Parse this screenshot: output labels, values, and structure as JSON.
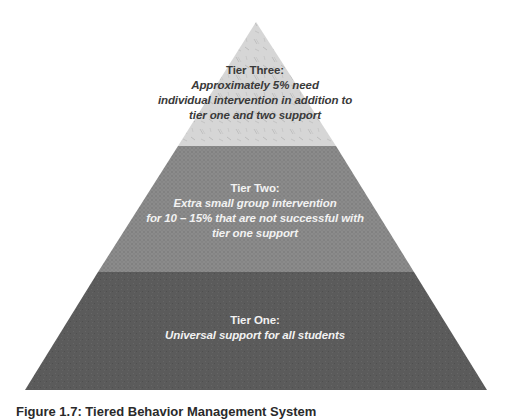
{
  "diagram": {
    "type": "pyramid",
    "apex": {
      "x": 256,
      "y": 22
    },
    "base": {
      "left": 25,
      "right": 487,
      "y": 390
    },
    "tiers": [
      {
        "id": "tier-three",
        "title": "Tier Three:",
        "lines": [
          "Approximately 5% need",
          "individual intervention in addition to",
          "tier one and two support"
        ],
        "fill": "#d6d6d6",
        "texture": "scattered-dashes",
        "text_color": "#3a3a3a"
      },
      {
        "id": "tier-two",
        "title": "Tier Two:",
        "lines": [
          "Extra small group intervention",
          "for 10 – 15% that are not successful with",
          "tier one support"
        ],
        "fill": "#8b8b8b",
        "texture": "crosshatch",
        "text_color": "#f2f2f2"
      },
      {
        "id": "tier-one",
        "title": "Tier One:",
        "lines": [
          "Universal support for all students"
        ],
        "fill": "#5b5b5b",
        "texture": "speckle",
        "text_color": "#f2f2f2"
      }
    ],
    "boundaries_y": [
      146,
      272
    ]
  },
  "caption": "Figure 1.7: Tiered Behavior Management System"
}
